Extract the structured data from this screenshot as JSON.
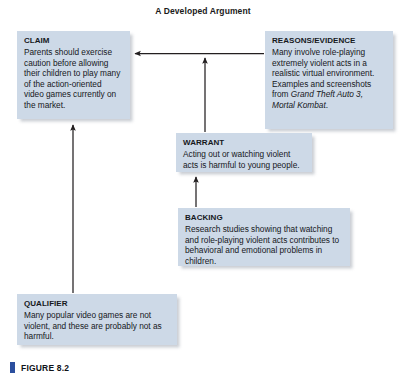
{
  "figure": {
    "title": "A Developed Argument",
    "caption": "FIGURE 8.2",
    "caption_marker_color": "#2b4f9e",
    "box_fill_color": "#cdd9e7",
    "arrow_color": "#231f20"
  },
  "nodes": {
    "claim": {
      "label": "CLAIM",
      "body": "Parents should exercise caution before allowing their children to play many of the action-oriented video games currently on the market."
    },
    "reasons": {
      "label": "REASONS/EVIDENCE",
      "body_before_italic": "Many involve role-playing extremely violent acts in a realistic virtual environment. Examples and screenshots from ",
      "body_italic": "Grand Theft Auto 3, Mortal Kombat",
      "body_after_italic": "."
    },
    "warrant": {
      "label": "WARRANT",
      "body": "Acting out or watching violent acts is harmful to young people."
    },
    "backing": {
      "label": "BACKING",
      "body": "Research studies showing that watching and role-playing violent acts contributes to behavioral and emotional problems in children."
    },
    "qualifier": {
      "label": "QUALIFIER",
      "body": "Many popular video games are not violent, and these are probably not as harmful."
    }
  },
  "connections": [
    {
      "name": "reasons-to-claim",
      "from": "reasons",
      "to": "claim",
      "direction": "left"
    },
    {
      "name": "warrant-to-claim-link",
      "from": "warrant",
      "to": "reasons-claim-link",
      "direction": "up"
    },
    {
      "name": "backing-to-warrant",
      "from": "backing",
      "to": "warrant",
      "direction": "up"
    },
    {
      "name": "qualifier-to-claim",
      "from": "qualifier",
      "to": "claim",
      "direction": "up"
    }
  ]
}
